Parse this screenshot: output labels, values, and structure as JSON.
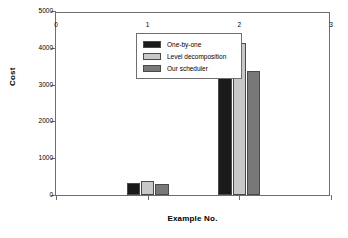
{
  "chart_data": {
    "type": "bar",
    "title": "",
    "xlabel": "Example No.",
    "ylabel": "Cost",
    "categories": [
      "1",
      "2"
    ],
    "x": [
      1,
      2
    ],
    "series": [
      {
        "name": "One-by-one",
        "values": [
          320,
          3900
        ],
        "color": "#1a1a1a"
      },
      {
        "name": "Level decomposition",
        "values": [
          380,
          4120
        ],
        "color": "#c8c8c8"
      },
      {
        "name": "Our scheduler",
        "values": [
          300,
          3370
        ],
        "color": "#787878"
      }
    ],
    "xlim": [
      0,
      3
    ],
    "ylim": [
      0,
      5000
    ],
    "xticks": [
      "0",
      "1",
      "2",
      "3"
    ],
    "xtick_values": [
      0,
      1,
      2,
      3
    ],
    "yticks": [
      "0",
      "1000",
      "2000",
      "3000",
      "4000",
      "5000"
    ],
    "ytick_values": [
      0,
      1000,
      2000,
      3000,
      4000,
      5000
    ],
    "grid": false,
    "legend_position": "upper-left-inside",
    "bar_width": 0.145,
    "group_gap": 0.01
  }
}
